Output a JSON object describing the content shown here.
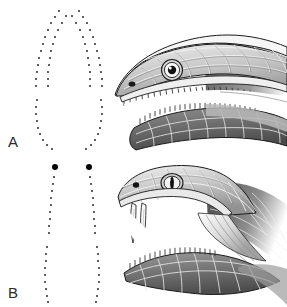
{
  "figure": {
    "background_color": "#ffffff",
    "width": 287,
    "height": 307,
    "ink_color": "#2b2b2b"
  },
  "panels": [
    {
      "id": "A",
      "label": "A",
      "subject": "non-venomous-snake-head",
      "description": "Aglyphous colubrid snake head in lateral view with open mouth showing numerous small uniform teeth",
      "eye": {
        "pupil_shape": "round",
        "pupil_color": "#111111",
        "iris_color": "#f2f2f2"
      },
      "tooth_type": "many small uniform teeth",
      "upper_tooth_count": 22,
      "lower_tooth_count": 24,
      "fang_count": 0,
      "dentition_map": {
        "caption": "palatal tooth-row pattern",
        "large_fang_dots": [],
        "rows": [
          {
            "name": "left-maxillary-row",
            "dot_size": 2.0,
            "points": [
              [
                59,
                11
              ],
              [
                55,
                17
              ],
              [
                51,
                23
              ],
              [
                48,
                30
              ],
              [
                45,
                37
              ],
              [
                43,
                44
              ],
              [
                41,
                51
              ],
              [
                39,
                58
              ],
              [
                38,
                65
              ],
              [
                37,
                72
              ],
              [
                36,
                79
              ],
              [
                36,
                86
              ]
            ]
          },
          {
            "name": "left-palatine-pterygoid-row",
            "dot_size": 2.0,
            "points": [
              [
                66,
                16
              ],
              [
                62,
                23
              ],
              [
                58,
                30
              ],
              [
                55,
                37
              ],
              [
                53,
                44
              ],
              [
                51,
                51
              ],
              [
                50,
                58
              ],
              [
                49,
                65
              ],
              [
                48,
                72
              ],
              [
                48,
                79
              ],
              [
                48,
                86
              ]
            ]
          },
          {
            "name": "right-maxillary-row",
            "dot_size": 2.0,
            "points": [
              [
                79,
                11
              ],
              [
                83,
                17
              ],
              [
                87,
                23
              ],
              [
                90,
                30
              ],
              [
                93,
                37
              ],
              [
                95,
                44
              ],
              [
                97,
                51
              ],
              [
                99,
                58
              ],
              [
                100,
                65
              ],
              [
                101,
                72
              ],
              [
                102,
                79
              ],
              [
                102,
                86
              ]
            ]
          },
          {
            "name": "right-palatine-pterygoid-row",
            "dot_size": 2.0,
            "points": [
              [
                72,
                16
              ],
              [
                76,
                23
              ],
              [
                80,
                30
              ],
              [
                83,
                37
              ],
              [
                85,
                44
              ],
              [
                87,
                51
              ],
              [
                88,
                58
              ],
              [
                89,
                65
              ],
              [
                90,
                72
              ],
              [
                90,
                79
              ],
              [
                90,
                86
              ]
            ]
          },
          {
            "name": "left-mandibular-row",
            "dot_size": 2.0,
            "points": [
              [
                37,
                100
              ],
              [
                36,
                107
              ],
              [
                36,
                114
              ],
              [
                37,
                121
              ],
              [
                38,
                128
              ],
              [
                40,
                134
              ],
              [
                43,
                140
              ],
              [
                47,
                145
              ],
              [
                52,
                149
              ]
            ]
          },
          {
            "name": "right-mandibular-row",
            "dot_size": 2.0,
            "points": [
              [
                101,
                100
              ],
              [
                102,
                107
              ],
              [
                102,
                114
              ],
              [
                101,
                121
              ],
              [
                100,
                128
              ],
              [
                98,
                134
              ],
              [
                95,
                140
              ],
              [
                91,
                145
              ],
              [
                86,
                149
              ]
            ]
          }
        ]
      }
    },
    {
      "id": "B",
      "label": "B",
      "subject": "venomous-viper-head",
      "description": "Solenoglyphous viper head in lateral view with widely gaped mouth and two long erected hollow fangs",
      "eye": {
        "pupil_shape": "vertical-slit",
        "pupil_color": "#111111",
        "iris_color": "#e8e8e8"
      },
      "tooth_type": "two large hollow fangs plus small teeth",
      "upper_tooth_count": 0,
      "lower_tooth_count": 18,
      "fang_count": 2,
      "dentition_map": {
        "caption": "palatal tooth-row pattern with enlarged fangs",
        "large_fang_dots": [
          [
            55,
            14
          ],
          [
            89,
            14
          ]
        ],
        "large_fang_dot_size": 6.0,
        "rows": [
          {
            "name": "left-palatine-pterygoid-row",
            "dot_size": 2.0,
            "points": [
              [
                54,
                24
              ],
              [
                53,
                31
              ],
              [
                52,
                38
              ],
              [
                51,
                45
              ],
              [
                51,
                52
              ],
              [
                50,
                59
              ],
              [
                50,
                66
              ],
              [
                49,
                73
              ],
              [
                49,
                80
              ]
            ]
          },
          {
            "name": "right-palatine-pterygoid-row",
            "dot_size": 2.0,
            "points": [
              [
                90,
                24
              ],
              [
                91,
                31
              ],
              [
                92,
                38
              ],
              [
                93,
                45
              ],
              [
                93,
                52
              ],
              [
                94,
                59
              ],
              [
                94,
                66
              ],
              [
                95,
                73
              ],
              [
                95,
                80
              ]
            ]
          },
          {
            "name": "left-mandibular-row",
            "dot_size": 2.0,
            "points": [
              [
                47,
                94
              ],
              [
                46,
                101
              ],
              [
                46,
                108
              ],
              [
                45,
                115
              ],
              [
                45,
                122
              ],
              [
                45,
                129
              ],
              [
                46,
                136
              ],
              [
                47,
                143
              ],
              [
                48,
                149
              ]
            ]
          },
          {
            "name": "right-mandibular-row",
            "dot_size": 2.0,
            "points": [
              [
                97,
                94
              ],
              [
                98,
                101
              ],
              [
                98,
                108
              ],
              [
                99,
                115
              ],
              [
                99,
                122
              ],
              [
                99,
                129
              ],
              [
                98,
                136
              ],
              [
                97,
                143
              ],
              [
                96,
                149
              ]
            ]
          }
        ]
      }
    }
  ],
  "palette": {
    "outline": "#1c1c1c",
    "scale_light": "#e6e6e6",
    "scale_mid": "#b4b4b4",
    "scale_dark": "#7d7d7d",
    "scale_darkest": "#4f4f4f",
    "mouth_interior": "#ffffff",
    "fang_fill": "#f4f4f4",
    "tooth_fill": "#e0e0e0"
  }
}
